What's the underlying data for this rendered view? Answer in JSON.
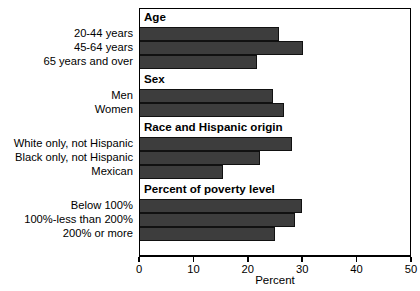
{
  "chart_data": {
    "type": "bar",
    "orientation": "horizontal",
    "title": "",
    "xlabel": "Percent",
    "ylabel": "",
    "xlim": [
      0,
      50
    ],
    "xticks": [
      0,
      10,
      20,
      30,
      40,
      50
    ],
    "xtick_labels": [
      "0",
      "10",
      "20",
      "30",
      "40",
      "50"
    ],
    "grid": false,
    "legend": null,
    "bar_color": "#3d3d3d",
    "groups": [
      {
        "header": "Age",
        "categories": [
          "20-44 years",
          "45-64 years",
          "65 years and over"
        ],
        "values": [
          25.5,
          30.0,
          21.5
        ]
      },
      {
        "header": "Sex",
        "categories": [
          "Men",
          "Women"
        ],
        "values": [
          24.5,
          26.5
        ]
      },
      {
        "header": "Race and Hispanic origin",
        "categories": [
          "White only, not Hispanic",
          "Black only, not Hispanic",
          "Mexican"
        ],
        "values": [
          28.0,
          22.0,
          15.3
        ]
      },
      {
        "header": "Percent of poverty level",
        "categories": [
          "Below 100%",
          "100%-less than 200%",
          "200% or more"
        ],
        "values": [
          29.8,
          28.5,
          24.8
        ]
      }
    ],
    "categories": [
      "20-44 years",
      "45-64 years",
      "65 years and over",
      "Men",
      "Women",
      "White only, not Hispanic",
      "Black only, not Hispanic",
      "Mexican",
      "Below 100%",
      "100%-less than 200%",
      "200% or more"
    ],
    "values": [
      25.5,
      30.0,
      21.5,
      24.5,
      26.5,
      28.0,
      22.0,
      15.3,
      29.8,
      28.5,
      24.8
    ]
  }
}
